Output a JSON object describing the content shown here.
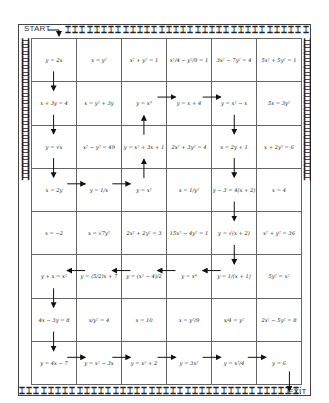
{
  "maze": {
    "start_label": "START",
    "exit_label": "EXIT",
    "rows": 8,
    "cols": 6,
    "border_glyph": "⌶",
    "cells": [
      [
        "y = 2x",
        "x = y²",
        "x² + y² = 1",
        "x²/4 − y²/9 = 1",
        "3x² − 7y² = 4",
        "5x² + 5y² = 1"
      ],
      [
        "x + 3y = 4",
        "x = y² + 3y",
        "y = x³",
        "y = x + 4",
        "y = x² − x",
        "5x = 3y²"
      ],
      [
        "y = √x",
        "x² − y² = 49",
        "y = x² + 3x + 1",
        "2x² + 3y² = 4",
        "x = 2y + 1",
        "x + 2y² = 6"
      ],
      [
        "x = 2y",
        "y = 1/x",
        "y = x²",
        "x = 1/y²",
        "y − 3 = 4(x + 2)",
        "x = 4"
      ],
      [
        "x = −2",
        "x = √7y²",
        "2x² + 2y² = 3",
        "15x² − 4y² = 1",
        "y = √(x + 2)",
        "x² + y² = 36"
      ],
      [
        "y + x = x²",
        "y = (5/2)x + 7",
        "y = (x² − 4)/2",
        "y = x⁴",
        "y = 1/(x + 1)",
        "5y² = x²"
      ],
      [
        "4x − 3y = 8",
        "x/y² = 4",
        "x = 10",
        "x = y²/9",
        "x/4 = y²",
        "2x² − 5y² = 8"
      ],
      [
        "y = 4x − 7",
        "y = x² − 3x",
        "y = x⁵ + 2",
        "y = 3x²",
        "y = x²/4",
        "y = 6"
      ]
    ],
    "path_arrows": [
      {
        "from": "start",
        "to": [
          0,
          0
        ],
        "dir": "down"
      },
      {
        "from": [
          0,
          0
        ],
        "to": [
          1,
          0
        ],
        "dir": "down"
      },
      {
        "from": [
          1,
          0
        ],
        "to": [
          2,
          0
        ],
        "dir": "down"
      },
      {
        "from": [
          2,
          0
        ],
        "to": [
          3,
          0
        ],
        "dir": "down"
      },
      {
        "from": [
          3,
          0
        ],
        "to": [
          3,
          1
        ],
        "dir": "right"
      },
      {
        "from": [
          3,
          1
        ],
        "to": [
          3,
          2
        ],
        "dir": "right"
      },
      {
        "from": [
          3,
          2
        ],
        "to": [
          2,
          2
        ],
        "dir": "up"
      },
      {
        "from": [
          2,
          2
        ],
        "to": [
          1,
          2
        ],
        "dir": "up"
      },
      {
        "from": [
          1,
          2
        ],
        "to": [
          1,
          3
        ],
        "dir": "right"
      },
      {
        "from": [
          1,
          3
        ],
        "to": [
          1,
          4
        ],
        "dir": "right"
      },
      {
        "from": [
          1,
          4
        ],
        "to": [
          2,
          4
        ],
        "dir": "down"
      },
      {
        "from": [
          2,
          4
        ],
        "to": [
          3,
          4
        ],
        "dir": "down"
      },
      {
        "from": [
          3,
          4
        ],
        "to": [
          4,
          4
        ],
        "dir": "down"
      },
      {
        "from": [
          4,
          4
        ],
        "to": [
          5,
          4
        ],
        "dir": "down"
      },
      {
        "from": [
          5,
          4
        ],
        "to": [
          5,
          3
        ],
        "dir": "left"
      },
      {
        "from": [
          5,
          3
        ],
        "to": [
          5,
          2
        ],
        "dir": "left"
      },
      {
        "from": [
          5,
          2
        ],
        "to": [
          5,
          1
        ],
        "dir": "left"
      },
      {
        "from": [
          5,
          1
        ],
        "to": [
          5,
          0
        ],
        "dir": "left"
      },
      {
        "from": [
          5,
          0
        ],
        "to": [
          6,
          0
        ],
        "dir": "down"
      },
      {
        "from": [
          6,
          0
        ],
        "to": [
          7,
          0
        ],
        "dir": "down"
      },
      {
        "from": [
          7,
          0
        ],
        "to": [
          7,
          1
        ],
        "dir": "right"
      },
      {
        "from": [
          7,
          1
        ],
        "to": [
          7,
          2
        ],
        "dir": "right"
      },
      {
        "from": [
          7,
          2
        ],
        "to": [
          7,
          3
        ],
        "dir": "right"
      },
      {
        "from": [
          7,
          3
        ],
        "to": [
          7,
          4
        ],
        "dir": "right"
      },
      {
        "from": [
          7,
          4
        ],
        "to": [
          7,
          5
        ],
        "dir": "right"
      },
      {
        "from": [
          7,
          5
        ],
        "to": "exit",
        "dir": "down"
      }
    ]
  }
}
